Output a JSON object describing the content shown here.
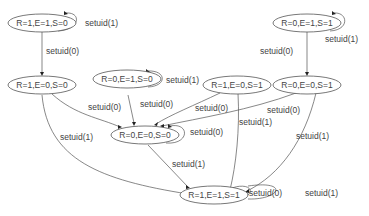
{
  "diagram": {
    "type": "state-machine",
    "colors": {
      "stroke": "#555555",
      "text": "#444444",
      "background": "#ffffff",
      "arrow": "#222222"
    },
    "nodes": [
      {
        "id": "n110a",
        "label": "R=1,E=1,S=0"
      },
      {
        "id": "n011",
        "label": "R=0,E=1,S=1"
      },
      {
        "id": "n100",
        "label": "R=1,E=0,S=0"
      },
      {
        "id": "n010",
        "label": "R=0,E=1,S=0"
      },
      {
        "id": "n101",
        "label": "R=1,E=0,S=1"
      },
      {
        "id": "n001",
        "label": "R=0,E=0,S=1"
      },
      {
        "id": "n000",
        "label": "R=0,E=0,S=0"
      },
      {
        "id": "n111",
        "label": "R=1,E=1,S=1"
      }
    ],
    "edges": [
      {
        "from": "R=1,E=1,S=0",
        "to": "R=1,E=1,S=0",
        "label": "setuid(1)"
      },
      {
        "from": "R=1,E=1,S=0",
        "to": "R=1,E=0,S=0",
        "label": "setuid(0)"
      },
      {
        "from": "R=0,E=1,S=1",
        "to": "R=0,E=1,S=1",
        "label": "setuid(1)"
      },
      {
        "from": "R=0,E=1,S=1",
        "to": "R=0,E=0,S=1",
        "label": "setuid(0)"
      },
      {
        "from": "R=0,E=1,S=0",
        "to": "R=0,E=1,S=0",
        "label": "setuid(1)"
      },
      {
        "from": "R=1,E=0,S=0",
        "to": "R=0,E=0,S=0",
        "label": "setuid(0)"
      },
      {
        "from": "R=1,E=0,S=0",
        "to": "R=1,E=1,S=1",
        "label": "setuid(1)"
      },
      {
        "from": "R=0,E=1,S=0",
        "to": "R=0,E=0,S=0",
        "label": "setuid(0)"
      },
      {
        "from": "R=1,E=0,S=1",
        "to": "R=0,E=0,S=0",
        "label": "setuid(0)"
      },
      {
        "from": "R=1,E=0,S=1",
        "to": "R=1,E=1,S=1",
        "label": "setuid(1)"
      },
      {
        "from": "R=0,E=0,S=1",
        "to": "R=0,E=0,S=0",
        "label": "setuid(0)"
      },
      {
        "from": "R=0,E=0,S=1",
        "to": "R=1,E=1,S=1",
        "label": "setuid(1)"
      },
      {
        "from": "R=0,E=0,S=0",
        "to": "R=0,E=0,S=0",
        "label": "setuid(0)"
      },
      {
        "from": "R=0,E=0,S=0",
        "to": "R=1,E=1,S=1",
        "label": "setuid(1)"
      },
      {
        "from": "R=1,E=1,S=1",
        "to": "R=1,E=1,S=1",
        "label": "setuid(0)"
      },
      {
        "from": "R=1,E=1,S=1",
        "to": "R=1,E=1,S=1",
        "label": "setuid(1)"
      }
    ]
  }
}
